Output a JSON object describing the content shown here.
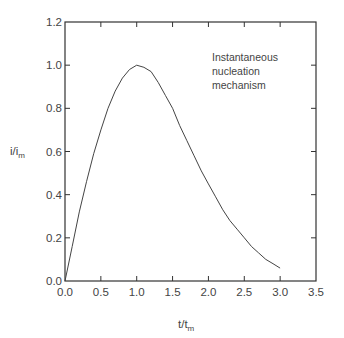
{
  "chart_data": {
    "type": "line",
    "title": "",
    "xlabel": "t/t",
    "xlabel_sub": "m",
    "ylabel": "i/i",
    "ylabel_sub": "m",
    "xlim": [
      0,
      3.5
    ],
    "ylim": [
      0,
      1.2
    ],
    "grid": false,
    "legend": null,
    "x_ticks": [
      "0.0",
      "0.5",
      "1.0",
      "1.5",
      "2.0",
      "2.5",
      "3.0",
      "3.5"
    ],
    "y_ticks": [
      "0.0",
      "0.2",
      "0.4",
      "0.6",
      "0.8",
      "1.0",
      "1.2"
    ],
    "annotation": [
      "Instantaneous",
      "nucleation",
      "mechanism"
    ],
    "series": [
      {
        "name": "Instantaneous nucleation mechanism",
        "x": [
          0.0,
          0.1,
          0.2,
          0.3,
          0.4,
          0.5,
          0.6,
          0.7,
          0.8,
          0.9,
          1.0,
          1.1,
          1.2,
          1.3,
          1.4,
          1.5,
          1.6,
          1.7,
          1.8,
          1.9,
          2.0,
          2.1,
          2.2,
          2.3,
          2.4,
          2.5,
          2.6,
          2.7,
          2.8,
          2.9,
          3.0
        ],
        "y": [
          0.0,
          0.16,
          0.32,
          0.46,
          0.59,
          0.7,
          0.8,
          0.88,
          0.94,
          0.98,
          1.0,
          0.99,
          0.97,
          0.92,
          0.86,
          0.8,
          0.72,
          0.65,
          0.58,
          0.51,
          0.45,
          0.39,
          0.33,
          0.28,
          0.24,
          0.2,
          0.16,
          0.13,
          0.1,
          0.08,
          0.06
        ]
      }
    ]
  }
}
